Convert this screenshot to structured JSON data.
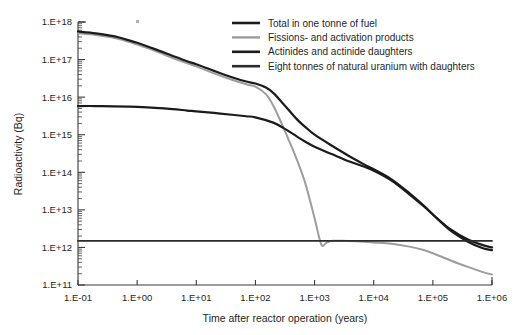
{
  "chart_data": {
    "type": "line",
    "title": "",
    "xlabel": "Time after reactor operation (years)",
    "ylabel": "Radioactivity (Bq)",
    "xscale": "log",
    "yscale": "log",
    "xlim": [
      0.1,
      1000000
    ],
    "ylim": [
      100000000000.0,
      1e+18
    ],
    "grid": false,
    "legend_position": "top-right",
    "xticklabels": [
      "1.E-01",
      "1.E+00",
      "1.E+01",
      "1.E+02",
      "1.E+03",
      "1.E+04",
      "1.E+05",
      "1.E+06"
    ],
    "xtickvalues": [
      0.1,
      1,
      10,
      100,
      1000,
      10000,
      100000,
      1000000
    ],
    "yticklabels": [
      "1.E+11",
      "1.E+12",
      "1.E+13",
      "1.E+14",
      "1.E+15",
      "1.E+16",
      "1.E+17",
      "1.E+18"
    ],
    "ytickvalues": [
      100000000000.0,
      1000000000000.0,
      10000000000000.0,
      100000000000000.0,
      1000000000000000.0,
      1e+16,
      1e+17,
      1e+18
    ],
    "series": [
      {
        "name": "Total in one tonne of fuel",
        "color": "#1b1b1b",
        "width": 2.2,
        "points": [
          [
            0.1,
            5.6e+17
          ],
          [
            0.2,
            5e+17
          ],
          [
            0.4,
            4.2e+17
          ],
          [
            0.7,
            3.3e+17
          ],
          [
            1.0,
            2.8e+17
          ],
          [
            2.0,
            1.9e+17
          ],
          [
            4.0,
            1.25e+17
          ],
          [
            7.0,
            9e+16
          ],
          [
            10,
            7.5e+16
          ],
          [
            20,
            5e+16
          ],
          [
            40,
            3.4e+16
          ],
          [
            70,
            2.6e+16
          ],
          [
            100,
            2.3e+16
          ],
          [
            150,
            1.8e+16
          ],
          [
            200,
            1.3e+16
          ],
          [
            300,
            6500000000000000.0
          ],
          [
            500,
            2600000000000000.0
          ],
          [
            700,
            1600000000000000.0
          ],
          [
            1000,
            1000000000000000.0
          ],
          [
            2000,
            500000000000000.0
          ],
          [
            4000,
            260000000000000.0
          ],
          [
            7000,
            160000000000000.0
          ],
          [
            10000,
            120000000000000.0
          ],
          [
            20000,
            65000000000000.0
          ],
          [
            40000,
            28000000000000.0
          ],
          [
            70000,
            13000000000000.0
          ],
          [
            100000,
            7500000000000.0
          ],
          [
            200000,
            3000000000000.0
          ],
          [
            400000,
            1600000000000.0
          ],
          [
            700000,
            1150000000000.0
          ],
          [
            1000000,
            1000000000000.0
          ]
        ]
      },
      {
        "name": "Fissions- and activation products",
        "color": "#9d9d9d",
        "width": 2.0,
        "points": [
          [
            0.1,
            5e+17
          ],
          [
            0.2,
            4.5e+17
          ],
          [
            0.4,
            3.8e+17
          ],
          [
            0.7,
            3e+17
          ],
          [
            1.0,
            2.5e+17
          ],
          [
            2.0,
            1.7e+17
          ],
          [
            4.0,
            1.1e+17
          ],
          [
            7.0,
            8e+16
          ],
          [
            10,
            6.6e+16
          ],
          [
            20,
            4.3e+16
          ],
          [
            40,
            2.9e+16
          ],
          [
            70,
            2.2e+16
          ],
          [
            100,
            1.9e+16
          ],
          [
            150,
            1.2e+16
          ],
          [
            200,
            6000000000000000.0
          ],
          [
            300,
            1500000000000000.0
          ],
          [
            500,
            220000000000000.0
          ],
          [
            700,
            50000000000000.0
          ],
          [
            1000,
            6000000000000.0
          ],
          [
            1300,
            1200000000000.0
          ],
          [
            1600,
            1350000000000.0
          ],
          [
            2000,
            1500000000000.0
          ],
          [
            3000,
            1500000000000.0
          ],
          [
            5000,
            1450000000000.0
          ],
          [
            10000,
            1350000000000.0
          ],
          [
            20000,
            1250000000000.0
          ],
          [
            40000,
            1050000000000.0
          ],
          [
            70000,
            850000000000.0
          ],
          [
            100000,
            700000000000.0
          ],
          [
            200000,
            450000000000.0
          ],
          [
            400000,
            300000000000.0
          ],
          [
            700000,
            220000000000.0
          ],
          [
            1000000,
            190000000000.0
          ]
        ]
      },
      {
        "name": "Actinides and actinide daughters",
        "color": "#1b1b1b",
        "width": 2.2,
        "points": [
          [
            0.1,
            5800000000000000.0
          ],
          [
            0.2,
            5800000000000000.0
          ],
          [
            0.4,
            5700000000000000.0
          ],
          [
            0.7,
            5600000000000000.0
          ],
          [
            1.0,
            5500000000000000.0
          ],
          [
            2.0,
            5200000000000000.0
          ],
          [
            4.0,
            4800000000000000.0
          ],
          [
            7.0,
            4400000000000000.0
          ],
          [
            10,
            4200000000000000.0
          ],
          [
            20,
            3800000000000000.0
          ],
          [
            40,
            3400000000000000.0
          ],
          [
            70,
            3100000000000000.0
          ],
          [
            100,
            2900000000000000.0
          ],
          [
            200,
            2100000000000000.0
          ],
          [
            300,
            1500000000000000.0
          ],
          [
            500,
            900000000000000.0
          ],
          [
            700,
            650000000000000.0
          ],
          [
            1000,
            480000000000000.0
          ],
          [
            2000,
            300000000000000.0
          ],
          [
            4000,
            190000000000000.0
          ],
          [
            7000,
            140000000000000.0
          ],
          [
            10000,
            110000000000000.0
          ],
          [
            20000,
            60000000000000.0
          ],
          [
            40000,
            26000000000000.0
          ],
          [
            70000,
            12500000000000.0
          ],
          [
            100000,
            7500000000000.0
          ],
          [
            200000,
            2800000000000.0
          ],
          [
            400000,
            1400000000000.0
          ],
          [
            700000,
            950000000000.0
          ],
          [
            1000000,
            850000000000.0
          ]
        ]
      },
      {
        "name": "Eight tonnes of natural uranium with daughters",
        "color": "#2b2b2b",
        "width": 1.8,
        "points": [
          [
            0.1,
            1500000000000.0
          ],
          [
            1000000,
            1500000000000.0
          ]
        ]
      }
    ]
  },
  "legend": {
    "entries": [
      {
        "label": "Total in one tonne of fuel",
        "color": "#1b1b1b"
      },
      {
        "label": "Fissions- and activation products",
        "color": "#9d9d9d"
      },
      {
        "label": "Actinides and actinide daughters",
        "color": "#1b1b1b"
      },
      {
        "label": "Eight tonnes of natural uranium with daughters",
        "color": "#2b2b2b"
      }
    ]
  },
  "axes": {
    "x_title": "Time after reactor operation (years)",
    "y_title": "Radioactivity (Bq)"
  },
  "colors": {
    "axis": "#3a3a3a",
    "text": "#1f1f1f",
    "gray_series": "#9d9d9d",
    "black_series": "#1b1b1b"
  }
}
